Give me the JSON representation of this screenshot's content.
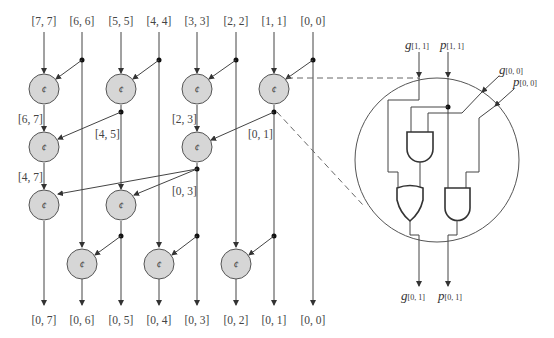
{
  "diagram": {
    "type": "parallel-prefix-adder-network",
    "node_symbol": "¢",
    "inputs": [
      "[7, 7]",
      "[6, 6]",
      "[5, 5]",
      "[4, 4]",
      "[3, 3]",
      "[2, 2]",
      "[1, 1]",
      "[0, 0]"
    ],
    "outputs": [
      "[0, 7]",
      "[0, 6]",
      "[0, 5]",
      "[0, 4]",
      "[0, 3]",
      "[0, 2]",
      "[0, 1]",
      "[0, 0]"
    ],
    "intermediate_labels": {
      "l67": "[6, 7]",
      "l45": "[4, 5]",
      "l23": "[2, 3]",
      "l01": "[0, 1]",
      "l47": "[4, 7]",
      "l03": "[0, 3]"
    },
    "zoom_detail": {
      "inputs": {
        "g11": "g",
        "g11_sub": "[1, 1]",
        "p11": "p",
        "p11_sub": "[1, 1]",
        "g00": "g",
        "g00_sub": "[0, 0]",
        "p00": "p",
        "p00_sub": "[0, 0]"
      },
      "outputs": {
        "g01": "g",
        "g01_sub": "[0, 1]",
        "p01": "p",
        "p01_sub": "[0, 1]"
      },
      "gates": [
        "AND",
        "OR",
        "AND"
      ]
    }
  }
}
